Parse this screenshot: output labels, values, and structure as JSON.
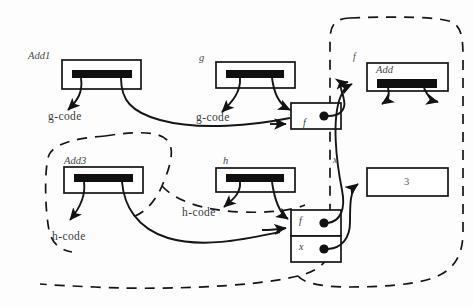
{
  "diagram": {
    "kind": "closure-environment-graph",
    "colors": {
      "ink": "#1a1a1a",
      "text": "#3b3b3b",
      "background": "#ffffff",
      "bar_fill": "#101010"
    },
    "regions": [
      {
        "id": "inner-region",
        "style": "dashed-rounded",
        "contains": [
          "Add3"
        ]
      },
      {
        "id": "outer-region",
        "style": "dashed-rounded",
        "contains": [
          "Add",
          "3",
          "f-cell",
          "f-x-pair"
        ]
      }
    ],
    "code_boxes": [
      {
        "id": "add1-box",
        "name": "Add1",
        "name_position": "above-left",
        "has_bar": true
      },
      {
        "id": "g-box",
        "name": "g",
        "name_position": "above-left",
        "has_bar": true
      },
      {
        "id": "add3-box",
        "name": "Add3",
        "name_position": "above-left",
        "has_bar": true
      },
      {
        "id": "h-box",
        "name": "h",
        "name_position": "above-left",
        "has_bar": true
      },
      {
        "id": "add-box",
        "name": "Add",
        "name_position": "inside-top-left",
        "has_bar": true
      }
    ],
    "value_labels": [
      {
        "id": "g-code-left",
        "text": "g-code"
      },
      {
        "id": "g-code-mid",
        "text": "g-code"
      },
      {
        "id": "h-code-left",
        "text": "h-code"
      },
      {
        "id": "h-code-mid",
        "text": "h-code"
      }
    ],
    "cells": [
      {
        "id": "f-cell-upper",
        "label": "f",
        "has_pointer_dot": true
      },
      {
        "id": "f-cell-lower",
        "label": "f",
        "has_pointer_dot": true
      },
      {
        "id": "x-cell-lower",
        "label": "x",
        "has_pointer_dot": true
      }
    ],
    "free_labels": [
      {
        "id": "closure-f",
        "text": "f"
      },
      {
        "id": "closure-x",
        "text": "x"
      }
    ],
    "literal_boxes": [
      {
        "id": "three-box",
        "value": "3"
      }
    ]
  }
}
